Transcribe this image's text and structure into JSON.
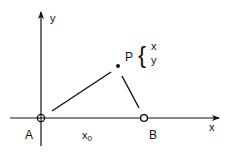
{
  "diagram": {
    "colors": {
      "ink": "#111111",
      "background": "#ffffff"
    },
    "axes": {
      "x_label": "x",
      "y_label": "y"
    },
    "points": {
      "A": {
        "label": "A",
        "marker": "circle-with-cross"
      },
      "B": {
        "label": "B",
        "marker": "open-circle"
      },
      "P": {
        "label": "P",
        "marker": "filled-dot"
      }
    },
    "P_coordinates": {
      "brace": "{",
      "line1": "x",
      "line2": "y"
    },
    "segment_label": {
      "text": "x",
      "subscript": "0"
    },
    "edges": [
      {
        "from": "A",
        "to": "P"
      },
      {
        "from": "P",
        "to": "B"
      }
    ]
  }
}
